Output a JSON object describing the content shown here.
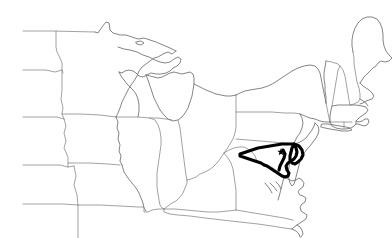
{
  "map": {
    "title": "Outline map of the eastern and midwestern United States",
    "description": "Black-and-white state outline map with Maryland highlighted in bold and its capital marked by a star.",
    "background_color": "#ffffff",
    "border_color": "#8a8a8a",
    "coast_color": "#6f6f6f",
    "highlight_color": "#000000",
    "width": 392,
    "height": 238,
    "highlighted_state": {
      "name": "Maryland",
      "stroke_color": "#000000",
      "stroke_width": 3.1
    },
    "capital_marker": {
      "name": "Annapolis",
      "symbol": "star",
      "x": 281,
      "y": 152,
      "color": "#000000"
    },
    "regions": [
      {
        "name": "North Dakota",
        "label": ""
      },
      {
        "name": "South Dakota",
        "label": ""
      },
      {
        "name": "Nebraska",
        "label": ""
      },
      {
        "name": "Kansas",
        "label": ""
      },
      {
        "name": "Minnesota",
        "label": ""
      },
      {
        "name": "Iowa",
        "label": ""
      },
      {
        "name": "Missouri",
        "label": ""
      },
      {
        "name": "Wisconsin",
        "label": ""
      },
      {
        "name": "Illinois",
        "label": ""
      },
      {
        "name": "Michigan",
        "label": ""
      },
      {
        "name": "Indiana",
        "label": ""
      },
      {
        "name": "Ohio",
        "label": ""
      },
      {
        "name": "Kentucky",
        "label": ""
      },
      {
        "name": "Tennessee",
        "label": ""
      },
      {
        "name": "West Virginia",
        "label": ""
      },
      {
        "name": "Virginia",
        "label": ""
      },
      {
        "name": "North Carolina",
        "label": ""
      },
      {
        "name": "Pennsylvania",
        "label": ""
      },
      {
        "name": "New York",
        "label": ""
      },
      {
        "name": "New Jersey",
        "label": ""
      },
      {
        "name": "Delaware",
        "label": ""
      },
      {
        "name": "Maryland",
        "label": ""
      },
      {
        "name": "Connecticut",
        "label": ""
      },
      {
        "name": "Rhode Island",
        "label": ""
      },
      {
        "name": "Massachusetts",
        "label": ""
      },
      {
        "name": "Vermont",
        "label": ""
      },
      {
        "name": "New Hampshire",
        "label": ""
      },
      {
        "name": "Maine",
        "label": ""
      }
    ]
  }
}
